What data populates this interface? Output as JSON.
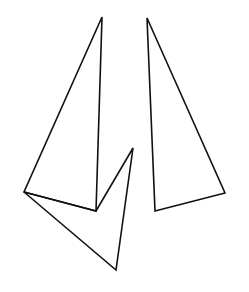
{
  "diagram": {
    "background": "#ffffff",
    "stroke_color": "#111111",
    "stroke_width": 1.6,
    "shapes": [
      {
        "name": "left-tall-triangle",
        "points": "102,17 96,211 24,192"
      },
      {
        "name": "lower-arrow-triangle",
        "points": "24,192 116,270 133,148 96,211"
      },
      {
        "name": "right-tall-triangle",
        "points": "147,18 225,193 155,211"
      }
    ]
  }
}
